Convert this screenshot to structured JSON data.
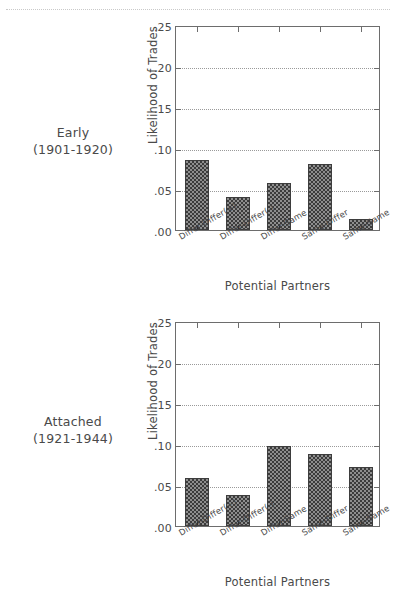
{
  "page": {
    "background": "#ffffff",
    "ink": "#4a4a4a"
  },
  "panels": [
    {
      "id": "early",
      "caption_line1": "Early",
      "caption_line2": "(1901-1920)",
      "chart_data": {
        "type": "bar",
        "title": "",
        "categories": [
          "Differ-Differ(+)",
          "Differ-Differ(-)",
          "Differ-Same",
          "Same-Differ",
          "Same-Same"
        ],
        "values": [
          0.085,
          0.04,
          0.057,
          0.08,
          0.014
        ],
        "xlabel": "Potential Partners",
        "ylabel": "Likelihood of Trades",
        "ylim": [
          0.0,
          0.25
        ],
        "yticks": [
          0.0,
          0.05,
          0.1,
          0.15,
          0.2,
          0.25
        ],
        "ytick_labels": [
          ".00",
          ".05",
          ".10",
          ".15",
          ".20",
          ".25"
        ],
        "grid": true,
        "grid_axis": "y",
        "legend": "none",
        "bar_fill": "crosshatch",
        "bar_color": "#8e8e8e",
        "bar_edge_color": "#3d3d3d"
      }
    },
    {
      "id": "attached",
      "caption_line1": "Attached",
      "caption_line2": "(1921-1944)",
      "chart_data": {
        "type": "bar",
        "title": "",
        "categories": [
          "Differ-Differ(+)",
          "Differ-Differ(-)",
          "Differ-Same",
          "Same-Differ",
          "Same-Same"
        ],
        "values": [
          0.058,
          0.038,
          0.098,
          0.088,
          0.072
        ],
        "xlabel": "Potential Partners",
        "ylabel": "Likelihood of Trades",
        "ylim": [
          0.0,
          0.25
        ],
        "yticks": [
          0.0,
          0.05,
          0.1,
          0.15,
          0.2,
          0.25
        ],
        "ytick_labels": [
          ".00",
          ".05",
          ".10",
          ".15",
          ".20",
          ".25"
        ],
        "grid": true,
        "grid_axis": "y",
        "legend": "none",
        "bar_fill": "crosshatch",
        "bar_color": "#8e8e8e",
        "bar_edge_color": "#3d3d3d"
      }
    }
  ]
}
